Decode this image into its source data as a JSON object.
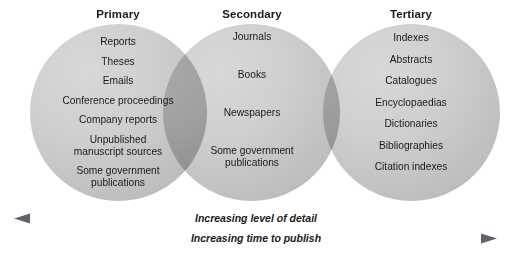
{
  "diagram": {
    "circles": [
      {
        "heading": "Primary",
        "items": [
          "Reports",
          "Theses",
          "Emails",
          "Conference proceedings",
          "Company reports",
          "Unpublished\nmanuscript sources",
          "Some government\npublications"
        ]
      },
      {
        "heading": "Secondary",
        "items": [
          "Journals",
          "Books",
          "Newspapers",
          "Some government\npublications"
        ]
      },
      {
        "heading": "Tertiary",
        "items": [
          "Indexes",
          "Abstracts",
          "Catalogues",
          "Encyclopaedias",
          "Dictionaries",
          "Bibliographies",
          "Citation indexes"
        ]
      }
    ],
    "arrows": [
      {
        "label": "Increasing level of detail",
        "direction": "left"
      },
      {
        "label": "Increasing time to publish",
        "direction": "right"
      }
    ],
    "colors": {
      "circle_fill": "#cfcfcf",
      "circle_edge": "#b2b2b2",
      "text": "#1a1a1a",
      "arrow_dark": "#6e6e78",
      "arrow_light": "#ffffff",
      "background": "#ffffff"
    }
  }
}
